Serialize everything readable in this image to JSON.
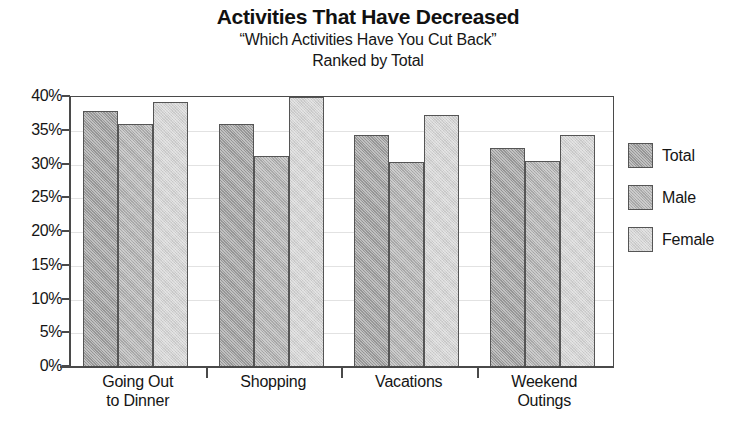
{
  "chart_data": {
    "type": "bar",
    "title": "Activities That Have Decreased",
    "subtitle": "“Which Activities Have You Cut Back”",
    "subtitle2": "Ranked by Total",
    "xlabel": "",
    "ylabel": "",
    "ylim": [
      0,
      40
    ],
    "ytick_step": 5,
    "ytick_labels": [
      "40%",
      "35%",
      "30%",
      "25%",
      "20%",
      "15%",
      "10%",
      "5%",
      "0%"
    ],
    "ytick_values": [
      40,
      35,
      30,
      25,
      20,
      15,
      10,
      5,
      0
    ],
    "grid": true,
    "legend_position": "right",
    "value_suffix": "%",
    "categories": [
      "Going Out to Dinner",
      "Shopping",
      "Vacations",
      "Weekend Outings"
    ],
    "category_lines": [
      [
        "Going Out",
        "to Dinner"
      ],
      [
        "Shopping",
        ""
      ],
      [
        "Vacations",
        ""
      ],
      [
        "Weekend",
        "Outings"
      ]
    ],
    "series": [
      {
        "name": "Total",
        "color": "#9b9b9b",
        "values": [
          38.0,
          36.0,
          34.3,
          32.4
        ]
      },
      {
        "name": "Male",
        "color": "#aeaeae",
        "values": [
          36.0,
          31.3,
          30.4,
          30.5
        ]
      },
      {
        "name": "Female",
        "color": "#d2d2d2",
        "values": [
          39.2,
          40.0,
          37.3,
          34.4
        ]
      }
    ]
  }
}
